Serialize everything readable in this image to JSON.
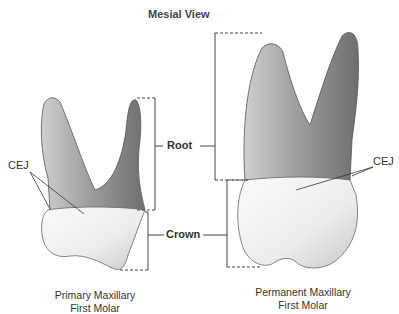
{
  "title": "Mesial View",
  "labels": {
    "root": "Root",
    "crown": "Crown",
    "cej_left": "CEJ",
    "cej_right": "CEJ"
  },
  "captions": {
    "primary": {
      "line1": "Primary Maxillary",
      "line2": "First Molar"
    },
    "permanent": {
      "line1": "Permanent Maxillary",
      "line2": "First Molar"
    }
  }
}
